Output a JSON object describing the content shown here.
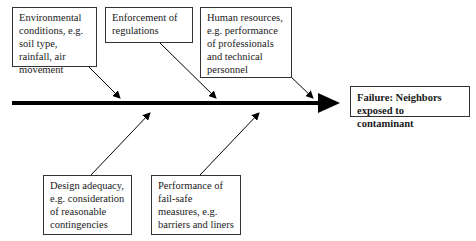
{
  "diagram": {
    "type": "fishbone",
    "effect": {
      "label": "Failure: Neighbors exposed to contaminant"
    },
    "causes_top": [
      {
        "label": "Environmental conditions, e.g. soil type, rainfall, air movement"
      },
      {
        "label": "Enforcement of regulations"
      },
      {
        "label": "Human resources, e.g. performance of professionals and technical personnel"
      }
    ],
    "causes_bottom": [
      {
        "label": "Design adequacy, e.g. consideration of reasonable contingencies"
      },
      {
        "label": "Performance of fail-safe measures, e.g. barriers and liners"
      }
    ],
    "colors": {
      "line": "#000000",
      "border": "#333333",
      "background": "#ffffff"
    }
  }
}
